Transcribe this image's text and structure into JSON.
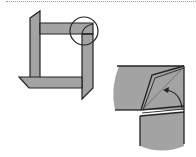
{
  "diagram": {
    "title": "",
    "kind": "origami-step",
    "colors": {
      "paper": "#a3a3a3",
      "outline": "#222222",
      "background": "#ffffff",
      "separator": "#9a9a9a"
    },
    "panels": [
      {
        "name": "frame-overview",
        "description": "Square frame assembled from four strips with corner highlighted by circle"
      },
      {
        "name": "corner-detail",
        "description": "Magnified corner showing flap folded with curved arrow"
      }
    ],
    "annotations": {
      "highlight": "circle",
      "arrow": "curved-fold-arrow"
    }
  }
}
